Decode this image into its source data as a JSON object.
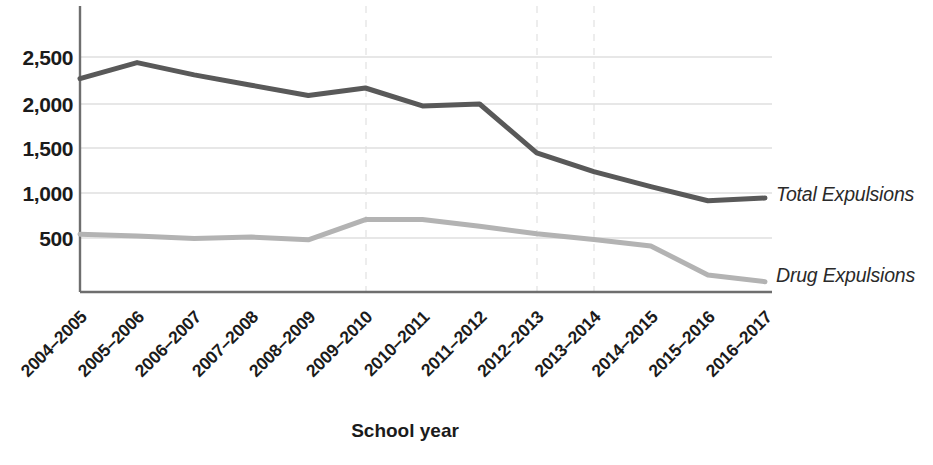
{
  "chart_data": {
    "type": "line",
    "title": "",
    "xlabel": "School year",
    "ylabel": "",
    "grid": true,
    "legend_position": "right-inline",
    "categories": [
      "2004–2005",
      "2005–2006",
      "2006–2007",
      "2007–2008",
      "2008–2009",
      "2009–2010",
      "2010–2011",
      "2011–2012",
      "2012–2013",
      "2013–2014",
      "2014–2015",
      "2015–2016",
      "2016–2017"
    ],
    "ylim": [
      0,
      2700
    ],
    "yticks": [
      500,
      1000,
      1500,
      2000,
      2500
    ],
    "ytick_labels": [
      "500",
      "1,000",
      "1,500",
      "2,000",
      "2,500"
    ],
    "series": [
      {
        "name": "Total Expulsions",
        "color": "#595959",
        "values": [
          2270,
          2440,
          2310,
          2200,
          2090,
          2170,
          1980,
          2000,
          1480,
          1280,
          1120,
          970,
          1000
        ]
      },
      {
        "name": "Drug Expulsions",
        "color": "#b3b3b3",
        "values": [
          615,
          595,
          570,
          585,
          555,
          770,
          770,
          700,
          620,
          560,
          490,
          180,
          110
        ]
      }
    ]
  },
  "axes": {
    "x_axis_title": "School year",
    "y_tick_labels": [
      "2,500",
      "2,000",
      "1,500",
      "1,000",
      "500"
    ]
  },
  "labels": {
    "total_expulsions": "Total Expulsions",
    "drug_expulsions": "Drug Expulsions"
  },
  "colors": {
    "total_line": "#595959",
    "drug_line": "#b3b3b3",
    "axis": "#6e6e6e",
    "gridline": "#cfcfcf",
    "vertical_gridline": "#e2e2e2",
    "text": "#1b1b1b"
  }
}
